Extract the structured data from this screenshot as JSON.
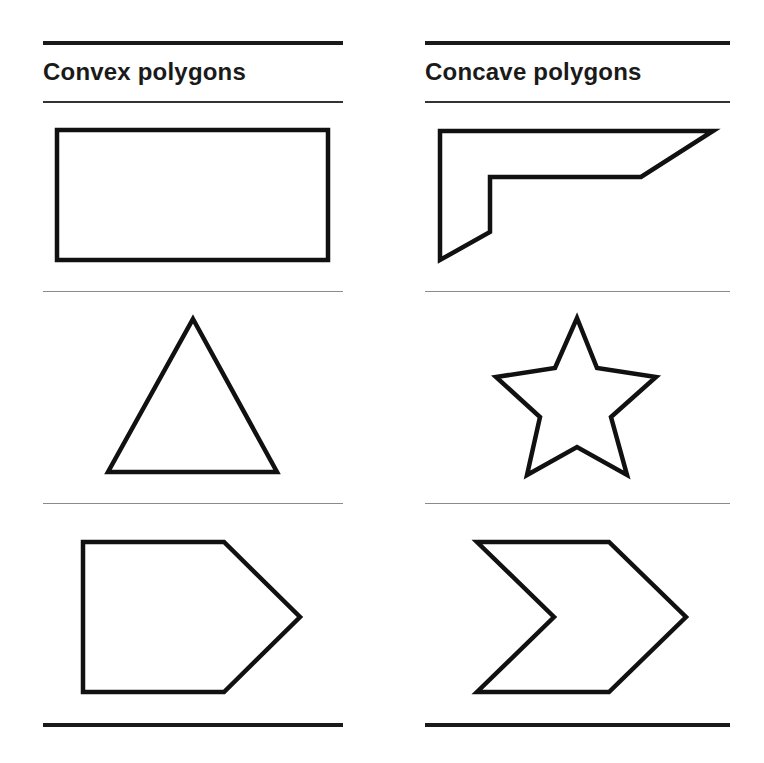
{
  "columns": [
    {
      "title": "Convex polygons",
      "shapes": [
        {
          "name": "rectangle",
          "points": "57,130 328,130 328,260 57,260"
        },
        {
          "name": "triangle",
          "points": "193,319 277,472 108,472"
        },
        {
          "name": "pentagon",
          "points": "83,542 224,542 300,617 224,692 83,692"
        }
      ]
    },
    {
      "title": "Concave polygons",
      "shapes": [
        {
          "name": "l-shape",
          "points": "440,131 713,131 641,177 490,177 490,232 440,260"
        },
        {
          "name": "star",
          "points": "577,318 597,368 656,377 611,417 627,475 577,447 527,475 540,417 496,377 555,368"
        },
        {
          "name": "chevron",
          "points": "477,542 609,542 686,617 609,692 477,692 554,617"
        }
      ]
    }
  ],
  "colors": {
    "stroke": "#111111",
    "rule": "#1a1a1a",
    "separator": "#8a8a8a",
    "background": "#ffffff"
  }
}
